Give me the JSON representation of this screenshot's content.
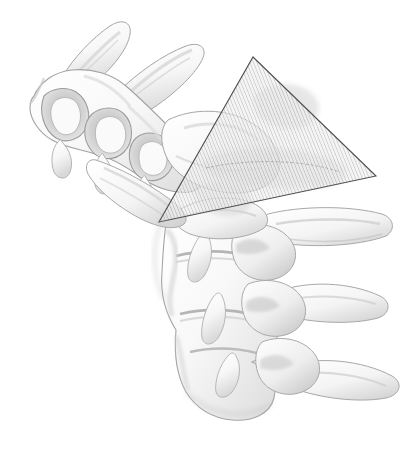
{
  "figure": {
    "title": "Cervical spine lateral oblique view with sectioning plane",
    "view": "lateral-oblique",
    "background_color": "#ffffff",
    "canvas": {
      "width": 416,
      "height": 453
    }
  },
  "palette": {
    "background": "#ffffff",
    "bone_light": "#fbfbfb",
    "bone_mid": "#ededed",
    "bone_shadow": "#c9c9c9",
    "bone_deep_shadow": "#a9a9a9",
    "outline": "#9a9a9a",
    "outline_soft": "#bdbdbd",
    "plane_fill": "#e9e9e9",
    "plane_hatch": "#8d8d8d",
    "plane_edge": "#5a5a5a"
  },
  "section_plane": {
    "name": "triangular-cut-plane",
    "shape": "triangle",
    "opacity": 0.55,
    "hatch_pattern": "diagonal-fine-lines",
    "hatch_spacing_px": 2,
    "hatch_angle_deg": -22,
    "edge_color": "#4f4f4f",
    "edge_width_px": 1,
    "vertices": [
      {
        "label": "apex",
        "x": 253,
        "y": 57
      },
      {
        "label": "right",
        "x": 376,
        "y": 176
      },
      {
        "label": "bottom-left",
        "x": 159,
        "y": 222
      }
    ],
    "points_attr": "253,57 376,176 159,222"
  },
  "anatomy": {
    "regions": [
      {
        "name": "upper-cervical-group",
        "label": "Upper cervical vertebrae (C1-C3)",
        "orientation": "upper-left",
        "elements": [
          "spinous-process-superior",
          "spinous-process-inferior",
          "posterior-arch",
          "lamina",
          "facet-joints"
        ]
      },
      {
        "name": "lower-cervical-group",
        "label": "Lower cervical vertebrae (C5-C7)",
        "orientation": "lower-right",
        "elements": [
          "vertebral-body",
          "intervertebral-disc-space",
          "transverse-process",
          "superior-articular-process",
          "pedicle"
        ]
      }
    ],
    "spinous_processes": [
      {
        "name": "spinous-process-upper",
        "tip_x": 120,
        "tip_y": 24
      },
      {
        "name": "spinous-process-lower",
        "tip_x": 192,
        "tip_y": 44
      }
    ],
    "transverse_processes": [
      {
        "name": "transverse-process-c5",
        "tip_x": 392,
        "tip_y": 238
      },
      {
        "name": "transverse-process-c6",
        "tip_x": 388,
        "tip_y": 318
      },
      {
        "name": "transverse-process-c7",
        "tip_x": 398,
        "tip_y": 398
      }
    ],
    "disc_spaces": [
      {
        "name": "disc-space-upper",
        "x": 218,
        "y": 258
      },
      {
        "name": "disc-space-mid",
        "x": 226,
        "y": 318
      },
      {
        "name": "disc-space-lower",
        "x": 236,
        "y": 352
      }
    ]
  },
  "labels": {
    "visible_text": []
  }
}
